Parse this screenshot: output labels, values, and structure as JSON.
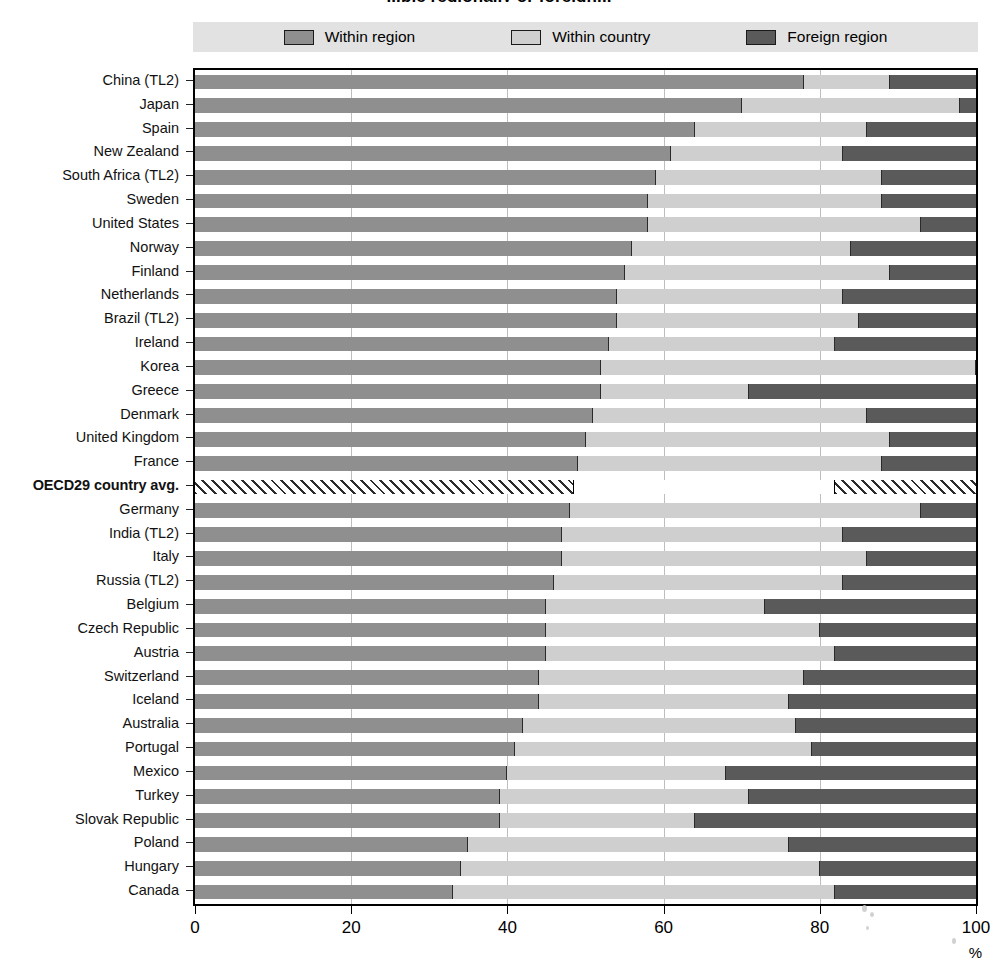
{
  "title": "...ble regionally or foreign...",
  "legend": {
    "position": "top",
    "items": [
      {
        "label": "Within region",
        "swatch": "within-region-swatch",
        "color": "#8f8f8f"
      },
      {
        "label": "Within country",
        "swatch": "within-country-swatch",
        "color": "#cfcfcf"
      },
      {
        "label": "Foreign region",
        "swatch": "foreign-region-swatch",
        "color": "#5a5a5a"
      }
    ]
  },
  "axis": {
    "x_label": "%",
    "x_ticks": [
      "0",
      "20",
      "40",
      "60",
      "80",
      "100"
    ],
    "x_min": 0,
    "x_max": 100
  },
  "chart_data": {
    "type": "bar",
    "orientation": "horizontal",
    "stacked": true,
    "title": "...ble regionally or foreign...",
    "xlabel": "%",
    "ylabel": "",
    "xlim": [
      0,
      100
    ],
    "xticks": [
      0,
      20,
      40,
      60,
      80,
      100
    ],
    "grid": true,
    "legend_position": "top",
    "series": [
      {
        "name": "Within region",
        "color": "#8f8f8f",
        "values": [
          78,
          70,
          64,
          61,
          59,
          58,
          58,
          56,
          55,
          54,
          54,
          53,
          52,
          52,
          51,
          50,
          49,
          48.5,
          48,
          47,
          47,
          46,
          45,
          45,
          45,
          44,
          44,
          42,
          41,
          40,
          39,
          39,
          35,
          34,
          33
        ]
      },
      {
        "name": "Within country",
        "color": "#cfcfcf",
        "values": [
          11,
          28,
          22,
          22,
          29,
          30,
          35,
          28,
          34,
          29,
          31,
          29,
          48,
          19,
          35,
          39,
          39,
          33.5,
          45,
          36,
          39,
          37,
          28,
          35,
          37,
          34,
          32,
          35,
          38,
          28,
          32,
          25,
          41,
          46,
          49
        ]
      },
      {
        "name": "Foreign region",
        "color": "#5a5a5a",
        "values": [
          11,
          2,
          14,
          17,
          12,
          12,
          7,
          16,
          11,
          17,
          15,
          18,
          0,
          29,
          14,
          11,
          12,
          18,
          7,
          17,
          14,
          17,
          27,
          20,
          18,
          22,
          24,
          23,
          21,
          32,
          29,
          36,
          24,
          20,
          18
        ]
      }
    ],
    "categories": [
      "China (TL2)",
      "Japan",
      "Spain",
      "New Zealand",
      "South Africa (TL2)",
      "Sweden",
      "United States",
      "Norway",
      "Finland",
      "Netherlands",
      "Brazil (TL2)",
      "Ireland",
      "Korea",
      "Greece",
      "Denmark",
      "United Kingdom",
      "France",
      "OECD29 country avg.",
      "Germany",
      "India (TL2)",
      "Italy",
      "Russia (TL2)",
      "Belgium",
      "Czech Republic",
      "Austria",
      "Switzerland",
      "Iceland",
      "Australia",
      "Portugal",
      "Mexico",
      "Turkey",
      "Slovak Republic",
      "Poland",
      "Hungary",
      "Canada"
    ],
    "highlight_category": "OECD29 country avg."
  }
}
